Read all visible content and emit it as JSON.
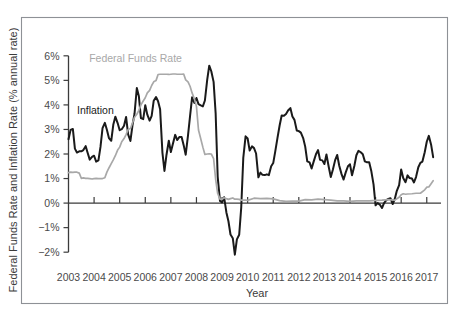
{
  "chart_data": {
    "type": "line",
    "title": "",
    "xlabel": "Year",
    "ylabel": "Federal Funds Rate and Inflation Rate (% annual rate)",
    "xlim": [
      2003,
      2017.4
    ],
    "ylim": [
      -2.4,
      6.4
    ],
    "ytick_values": [
      6,
      5,
      4,
      3,
      2,
      1,
      0,
      -1,
      -2
    ],
    "ytick_labels": [
      "6%",
      "5%",
      "4%",
      "3%",
      "2%",
      "1%",
      "0%",
      "−1%",
      "−2%"
    ],
    "xtick_values": [
      2003,
      2004,
      2005,
      2006,
      2007,
      2008,
      2009,
      2010,
      2011,
      2012,
      2013,
      2014,
      2015,
      2016,
      2017
    ],
    "xtick_labels": [
      "2003",
      "2004",
      "2005",
      "2006",
      "2007",
      "2008",
      "2009",
      "2010",
      "2011",
      "2012",
      "2013",
      "2014",
      "2015",
      "2016",
      "2017"
    ],
    "grid": false,
    "legend_position": "inline-annotations",
    "zero_line": 0,
    "series": [
      {
        "name": "Inflation",
        "color": "#1a1a1a",
        "label_x": 2004.05,
        "label_y": 3.62,
        "x": [
          2003.0,
          2003.08,
          2003.17,
          2003.25,
          2003.33,
          2003.42,
          2003.5,
          2003.58,
          2003.67,
          2003.75,
          2003.83,
          2003.92,
          2004.0,
          2004.08,
          2004.17,
          2004.25,
          2004.33,
          2004.42,
          2004.5,
          2004.58,
          2004.67,
          2004.75,
          2004.83,
          2004.92,
          2005.0,
          2005.08,
          2005.17,
          2005.25,
          2005.33,
          2005.42,
          2005.5,
          2005.58,
          2005.67,
          2005.75,
          2005.83,
          2005.92,
          2006.0,
          2006.08,
          2006.17,
          2006.25,
          2006.33,
          2006.42,
          2006.5,
          2006.58,
          2006.67,
          2006.75,
          2006.83,
          2006.92,
          2007.0,
          2007.08,
          2007.17,
          2007.25,
          2007.33,
          2007.42,
          2007.5,
          2007.58,
          2007.67,
          2007.75,
          2007.83,
          2007.92,
          2008.0,
          2008.08,
          2008.17,
          2008.25,
          2008.33,
          2008.42,
          2008.5,
          2008.58,
          2008.67,
          2008.75,
          2008.83,
          2008.92,
          2009.0,
          2009.08,
          2009.17,
          2009.25,
          2009.33,
          2009.42,
          2009.5,
          2009.58,
          2009.67,
          2009.75,
          2009.83,
          2009.92,
          2010.0,
          2010.08,
          2010.17,
          2010.25,
          2010.33,
          2010.42,
          2010.5,
          2010.58,
          2010.67,
          2010.75,
          2010.83,
          2010.92,
          2011.0,
          2011.08,
          2011.17,
          2011.25,
          2011.33,
          2011.42,
          2011.5,
          2011.58,
          2011.67,
          2011.75,
          2011.83,
          2011.92,
          2012.0,
          2012.08,
          2012.17,
          2012.25,
          2012.33,
          2012.42,
          2012.5,
          2012.58,
          2012.67,
          2012.75,
          2012.83,
          2012.92,
          2013.0,
          2013.08,
          2013.17,
          2013.25,
          2013.33,
          2013.42,
          2013.5,
          2013.58,
          2013.67,
          2013.75,
          2013.83,
          2013.92,
          2014.0,
          2014.08,
          2014.17,
          2014.25,
          2014.33,
          2014.42,
          2014.5,
          2014.58,
          2014.67,
          2014.75,
          2014.83,
          2014.92,
          2015.0,
          2015.08,
          2015.17,
          2015.25,
          2015.33,
          2015.42,
          2015.5,
          2015.58,
          2015.67,
          2015.75,
          2015.83,
          2015.92,
          2016.0,
          2016.08,
          2016.17,
          2016.25,
          2016.33,
          2016.42,
          2016.5,
          2016.58,
          2016.67,
          2016.75,
          2016.83,
          2016.92,
          2017.0,
          2017.08,
          2017.17,
          2017.25
        ],
        "y": [
          2.6,
          2.98,
          3.02,
          2.22,
          2.06,
          2.11,
          2.11,
          2.16,
          2.32,
          2.04,
          1.77,
          1.88,
          1.93,
          1.69,
          1.74,
          2.29,
          3.05,
          3.27,
          2.99,
          2.65,
          2.54,
          3.19,
          3.52,
          3.26,
          2.97,
          3.01,
          3.15,
          3.51,
          2.8,
          2.53,
          3.17,
          3.64,
          4.69,
          4.35,
          3.46,
          3.42,
          3.99,
          3.6,
          3.36,
          3.55,
          4.17,
          4.32,
          4.15,
          3.82,
          2.06,
          1.31,
          1.97,
          2.54,
          2.08,
          2.42,
          2.78,
          2.57,
          2.69,
          2.69,
          2.36,
          1.97,
          2.76,
          3.54,
          4.31,
          4.08,
          4.28,
          4.03,
          3.98,
          3.94,
          4.18,
          5.02,
          5.6,
          5.37,
          4.94,
          3.66,
          1.07,
          0.09,
          0.03,
          0.24,
          -0.38,
          -0.74,
          -1.28,
          -1.43,
          -2.1,
          -1.48,
          -1.29,
          -0.18,
          1.84,
          2.72,
          2.63,
          2.14,
          2.31,
          2.24,
          2.02,
          1.05,
          1.24,
          1.15,
          1.14,
          1.17,
          1.14,
          1.5,
          1.63,
          2.11,
          2.68,
          3.16,
          3.57,
          3.56,
          3.63,
          3.77,
          3.87,
          3.53,
          3.39,
          2.96,
          2.93,
          2.87,
          2.65,
          2.3,
          1.7,
          1.66,
          1.41,
          1.69,
          1.99,
          2.16,
          1.76,
          1.74,
          1.59,
          1.98,
          1.47,
          1.06,
          1.36,
          1.75,
          1.96,
          1.52,
          1.18,
          0.96,
          1.24,
          1.5,
          1.58,
          1.13,
          1.51,
          1.95,
          2.13,
          2.07,
          1.99,
          1.7,
          1.66,
          1.66,
          1.32,
          0.76,
          -0.09,
          0.0,
          -0.07,
          -0.2,
          0.0,
          0.12,
          0.17,
          0.2,
          -0.04,
          0.17,
          0.5,
          0.73,
          1.37,
          1.02,
          0.85,
          1.13,
          1.02,
          1.0,
          0.84,
          1.06,
          1.46,
          1.64,
          1.69,
          2.07,
          2.5,
          2.74,
          2.38,
          1.87
        ]
      },
      {
        "name": "Federal Funds Rate",
        "color": "#a8a8a8",
        "label_x": 2005.62,
        "label_y": 5.73,
        "x": [
          2003.0,
          2003.08,
          2003.17,
          2003.25,
          2003.33,
          2003.42,
          2003.5,
          2003.58,
          2003.67,
          2003.75,
          2003.83,
          2003.92,
          2004.0,
          2004.08,
          2004.17,
          2004.25,
          2004.33,
          2004.42,
          2004.5,
          2004.58,
          2004.67,
          2004.75,
          2004.83,
          2004.92,
          2005.0,
          2005.08,
          2005.17,
          2005.25,
          2005.33,
          2005.42,
          2005.5,
          2005.58,
          2005.67,
          2005.75,
          2005.83,
          2005.92,
          2006.0,
          2006.08,
          2006.17,
          2006.25,
          2006.33,
          2006.42,
          2006.5,
          2006.58,
          2006.67,
          2006.75,
          2006.83,
          2006.92,
          2007.0,
          2007.08,
          2007.17,
          2007.25,
          2007.33,
          2007.42,
          2007.5,
          2007.58,
          2007.67,
          2007.75,
          2007.83,
          2007.92,
          2008.0,
          2008.08,
          2008.17,
          2008.25,
          2008.33,
          2008.42,
          2008.5,
          2008.58,
          2008.67,
          2008.75,
          2008.83,
          2008.92,
          2009.0,
          2009.08,
          2009.17,
          2009.25,
          2009.33,
          2009.42,
          2009.5,
          2009.58,
          2009.67,
          2009.75,
          2009.83,
          2009.92,
          2010.0,
          2010.25,
          2010.5,
          2010.75,
          2011.0,
          2011.25,
          2011.5,
          2011.75,
          2012.0,
          2012.25,
          2012.5,
          2012.75,
          2013.0,
          2013.25,
          2013.5,
          2013.75,
          2014.0,
          2014.25,
          2014.5,
          2014.75,
          2015.0,
          2015.25,
          2015.5,
          2015.75,
          2015.92,
          2016.0,
          2016.08,
          2016.17,
          2016.25,
          2016.42,
          2016.58,
          2016.75,
          2016.92,
          2017.0,
          2017.08,
          2017.17,
          2017.25
        ],
        "y": [
          1.24,
          1.26,
          1.25,
          1.26,
          1.26,
          1.22,
          1.01,
          1.03,
          1.01,
          1.01,
          1.0,
          0.98,
          1.0,
          1.01,
          1.0,
          1.0,
          1.0,
          1.03,
          1.26,
          1.43,
          1.61,
          1.76,
          1.93,
          2.16,
          2.28,
          2.5,
          2.63,
          2.79,
          3.0,
          3.04,
          3.26,
          3.5,
          3.62,
          3.78,
          4.0,
          4.16,
          4.29,
          4.49,
          4.59,
          4.79,
          4.94,
          4.99,
          5.24,
          5.25,
          5.25,
          5.25,
          5.25,
          5.24,
          5.25,
          5.26,
          5.26,
          5.25,
          5.25,
          5.25,
          5.26,
          5.02,
          4.94,
          4.76,
          4.49,
          4.24,
          3.94,
          2.98,
          2.61,
          2.28,
          1.98,
          2.0,
          2.01,
          2.0,
          1.81,
          0.97,
          0.39,
          0.16,
          0.15,
          0.22,
          0.18,
          0.15,
          0.18,
          0.21,
          0.16,
          0.16,
          0.15,
          0.12,
          0.12,
          0.12,
          0.11,
          0.2,
          0.18,
          0.19,
          0.17,
          0.1,
          0.07,
          0.08,
          0.08,
          0.14,
          0.13,
          0.16,
          0.14,
          0.12,
          0.09,
          0.09,
          0.07,
          0.09,
          0.09,
          0.09,
          0.11,
          0.12,
          0.14,
          0.12,
          0.24,
          0.34,
          0.38,
          0.36,
          0.37,
          0.38,
          0.4,
          0.4,
          0.54,
          0.65,
          0.66,
          0.79,
          0.91
        ]
      }
    ]
  }
}
